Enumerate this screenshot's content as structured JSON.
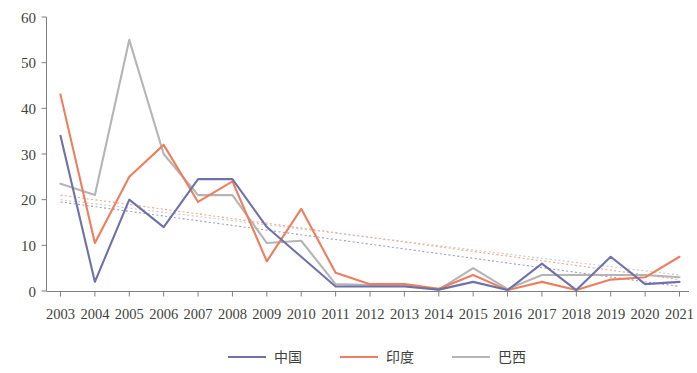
{
  "chart_data": {
    "type": "line",
    "title": "",
    "subtitle": "",
    "xlabel": "",
    "ylabel": "",
    "categories": [
      "2003",
      "2004",
      "2005",
      "2006",
      "2007",
      "2008",
      "2009",
      "2010",
      "2011",
      "2012",
      "2013",
      "2014",
      "2015",
      "2016",
      "2017",
      "2018",
      "2019",
      "2020",
      "2021"
    ],
    "ylim": [
      0,
      60
    ],
    "yticks": [
      0,
      10,
      20,
      30,
      40,
      50,
      60
    ],
    "grid": false,
    "legend_position": "bottom-center",
    "series": [
      {
        "name": "中国",
        "color": "#6f72a8",
        "values": [
          34,
          2,
          20,
          14,
          24.5,
          24.5,
          14,
          7.5,
          1,
          1,
          1,
          0.3,
          2,
          0.2,
          6,
          0.2,
          7.5,
          1.5,
          2
        ]
      },
      {
        "name": "印度",
        "color": "#ec7f60",
        "values": [
          43,
          10.5,
          25,
          32,
          19.5,
          24,
          6.5,
          18,
          4,
          1.5,
          1.5,
          0.5,
          3.5,
          0.2,
          2,
          0.2,
          2.5,
          3,
          7.5
        ]
      },
      {
        "name": "巴西",
        "color": "#b5b5b5",
        "values": [
          23.5,
          21,
          55,
          30,
          21,
          21,
          10.5,
          11,
          1.5,
          1.3,
          1.3,
          0.3,
          5,
          0.4,
          3.5,
          3.5,
          3.5,
          3.5,
          3
        ]
      }
    ],
    "trendlines": [
      {
        "series": "中国",
        "color": "#9a9cc4",
        "style": "dotted",
        "start": {
          "x": "2003",
          "y": 19.5
        },
        "end": {
          "x": "2021",
          "y": 1.0
        }
      },
      {
        "series": "印度",
        "color": "#f0a890",
        "style": "dotted",
        "start": {
          "x": "2003",
          "y": 21.0
        },
        "end": {
          "x": "2021",
          "y": 2.5
        }
      },
      {
        "series": "巴西",
        "color": "#c9c9c9",
        "style": "dotted",
        "start": {
          "x": "2003",
          "y": 20.0
        },
        "end": {
          "x": "2021",
          "y": 3.5
        }
      }
    ]
  },
  "legend": {
    "items": [
      {
        "label": "中国",
        "color": "#6f72a8"
      },
      {
        "label": "印度",
        "color": "#ec7f60"
      },
      {
        "label": "巴西",
        "color": "#b5b5b5"
      }
    ]
  },
  "axes": {
    "y_tick_labels": [
      "60",
      "50",
      "40",
      "30",
      "20",
      "10",
      "0"
    ],
    "x_tick_labels": [
      "2003",
      "2004",
      "2005",
      "2006",
      "2007",
      "2008",
      "2009",
      "2010",
      "2011",
      "2012",
      "2013",
      "2014",
      "2015",
      "2016",
      "2017",
      "2018",
      "2019",
      "2020",
      "2021"
    ]
  }
}
